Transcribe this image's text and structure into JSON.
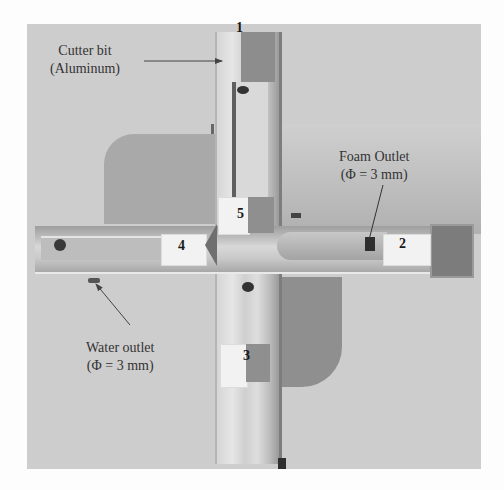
{
  "figure": {
    "annotations": {
      "cutter_bit": {
        "line1": "Cutter bit",
        "line2": "(Aluminum)"
      },
      "foam_outlet": {
        "line1": "Foam Outlet",
        "line2": "(Φ = 3 mm)"
      },
      "water_outlet": {
        "line1": "Water outlet",
        "line2": "(Φ = 3 mm)"
      }
    },
    "block_numbers": [
      "1",
      "2",
      "3",
      "4",
      "5"
    ],
    "colors": {
      "page_background": "#fdfdfd",
      "photo_background": "#cdcdcd",
      "text": "#333333"
    }
  }
}
